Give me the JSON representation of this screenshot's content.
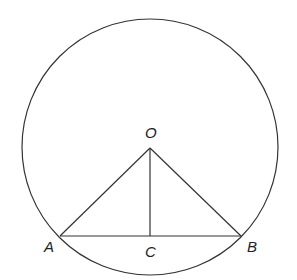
{
  "diagram": {
    "circle": {
      "cx": 150,
      "cy": 147,
      "r": 128
    },
    "points": {
      "O": {
        "x": 150,
        "y": 148
      },
      "A": {
        "x": 60,
        "y": 236
      },
      "B": {
        "x": 241,
        "y": 236
      },
      "C": {
        "x": 150,
        "y": 236
      }
    },
    "labels": {
      "O": "O",
      "A": "A",
      "B": "B",
      "C": "C"
    },
    "segments": [
      [
        "O",
        "A"
      ],
      [
        "O",
        "B"
      ],
      [
        "O",
        "C"
      ],
      [
        "A",
        "B"
      ]
    ],
    "color": "#333333"
  }
}
